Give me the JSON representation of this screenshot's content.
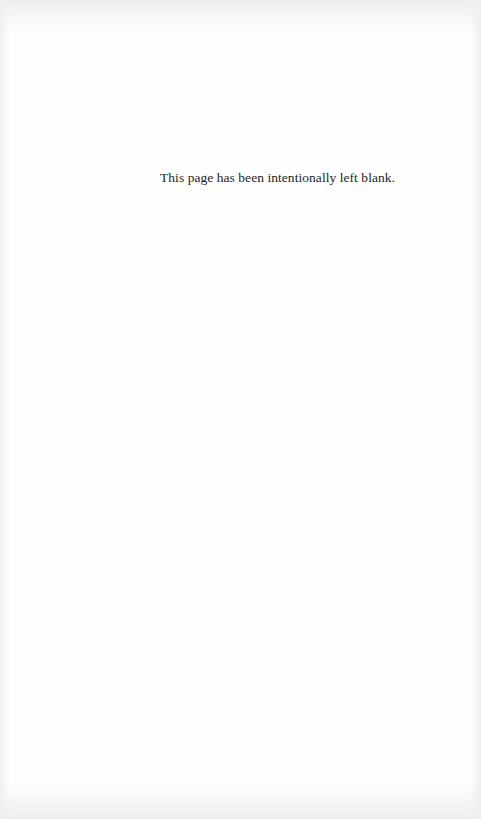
{
  "page": {
    "notice_text": "This page has been intentionally left blank.",
    "background_color": "#fefefe",
    "text_color": "#1e1e1e"
  }
}
